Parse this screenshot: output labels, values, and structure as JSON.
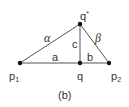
{
  "diagram": {
    "caption": "(b)",
    "points": {
      "p1": {
        "label": "p",
        "sub": "1"
      },
      "q": {
        "label": "q"
      },
      "p2": {
        "label": "p",
        "sub": "2"
      },
      "qstar": {
        "label": "q",
        "sup": "*"
      }
    },
    "edges": {
      "alpha": "α",
      "beta": "β",
      "c": "c",
      "a": "a",
      "b": "b"
    },
    "colors": {
      "line": "#555555",
      "point": "#111111",
      "text": "#333333"
    }
  }
}
